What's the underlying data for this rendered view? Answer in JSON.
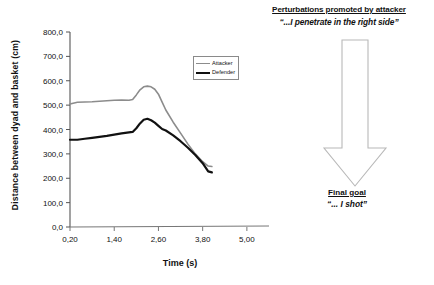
{
  "chart_data": {
    "type": "line",
    "title": "",
    "xlabel": "Time (s)",
    "ylabel": "Distance between dyad and basket (cm)",
    "xlim": [
      0.2,
      5.6
    ],
    "ylim": [
      0.0,
      800.0
    ],
    "grid": false,
    "legend_position": "top-right",
    "xticks": [
      "0,20",
      "1,40",
      "2,60",
      "3,80",
      "5,00"
    ],
    "xtick_values": [
      0.2,
      1.4,
      2.6,
      3.8,
      5.0
    ],
    "yticks": [
      "0,0",
      "100,0",
      "200,0",
      "300,0",
      "400,0",
      "500,0",
      "600,0",
      "700,0",
      "800,0"
    ],
    "ytick_values": [
      0,
      100,
      200,
      300,
      400,
      500,
      600,
      700,
      800
    ],
    "x": [
      0.2,
      0.4,
      0.6,
      0.8,
      1.0,
      1.2,
      1.4,
      1.6,
      1.8,
      1.9,
      2.0,
      2.1,
      2.2,
      2.3,
      2.4,
      2.5,
      2.6,
      2.7,
      2.8,
      3.0,
      3.2,
      3.4,
      3.6,
      3.8,
      3.95,
      4.05
    ],
    "series": [
      {
        "name": "Attacker",
        "color": "#8c8c8c",
        "width": 1.6,
        "values": [
          505,
          512,
          513,
          514,
          516,
          518,
          520,
          521,
          520,
          523,
          542,
          563,
          575,
          578,
          575,
          565,
          545,
          512,
          480,
          430,
          385,
          340,
          300,
          268,
          250,
          248
        ]
      },
      {
        "name": "Defender",
        "color": "#111111",
        "width": 2.2,
        "values": [
          358,
          358,
          362,
          366,
          370,
          374,
          379,
          384,
          388,
          390,
          405,
          425,
          440,
          444,
          438,
          428,
          415,
          402,
          396,
          376,
          352,
          325,
          295,
          262,
          228,
          224
        ]
      }
    ]
  },
  "legend": {
    "items": [
      {
        "label": "Attacker",
        "color": "#8c8c8c",
        "thickness": "1.6px"
      },
      {
        "label": "Defender",
        "color": "#111111",
        "thickness": "2.4px"
      }
    ]
  },
  "annotations": {
    "top": {
      "heading": "Perturbations promoted by attacker",
      "quote": "“...I penetrate in the right side”"
    },
    "bottom": {
      "heading": "Final goal",
      "quote": "“... I shot”"
    },
    "arrow": {
      "name": "down-arrow",
      "fill": "#ffffff",
      "stroke": "#b8b8b8",
      "direction": "down"
    }
  }
}
